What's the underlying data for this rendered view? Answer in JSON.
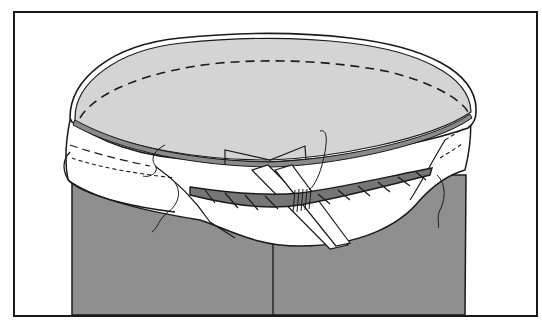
{
  "figure": {
    "colors": {
      "background": "#ffffff",
      "frame": "#1a1a1a",
      "pants_fill": "#8f8f8f",
      "interior_fill": "#d4d4d4",
      "waistband_rim": "#8a8a8a",
      "rope_fill": "#767676",
      "lining_fill": "#ffffff",
      "ink": "#1a1a1a"
    },
    "labels": []
  }
}
